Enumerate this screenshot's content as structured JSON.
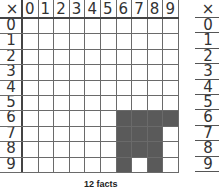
{
  "table": {
    "corner": "×",
    "column_headers": [
      "0",
      "1",
      "2",
      "3",
      "4",
      "5",
      "6",
      "7",
      "8",
      "9"
    ],
    "row_headers": [
      "0",
      "1",
      "2",
      "3",
      "4",
      "5",
      "6",
      "7",
      "8",
      "9"
    ],
    "filled_cells": [
      [
        6,
        6
      ],
      [
        6,
        7
      ],
      [
        6,
        8
      ],
      [
        6,
        9
      ],
      [
        7,
        6
      ],
      [
        7,
        7
      ],
      [
        7,
        8
      ],
      [
        8,
        6
      ],
      [
        8,
        7
      ],
      [
        8,
        8
      ],
      [
        9,
        6
      ],
      [
        9,
        8
      ]
    ],
    "fill_color": "#5a5a5a"
  },
  "caption": "12 facts",
  "side_table": {
    "corner": "×",
    "row_headers": [
      "0",
      "1",
      "2",
      "3",
      "4",
      "5",
      "6",
      "7",
      "8",
      "9"
    ]
  }
}
